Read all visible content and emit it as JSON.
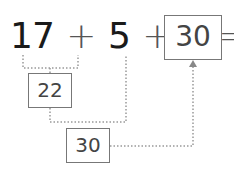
{
  "equation": {
    "terms": [
      "17",
      "5",
      "8"
    ],
    "operators": [
      "+",
      "+",
      "="
    ],
    "result": "30"
  },
  "intermediate_boxes": [
    {
      "label": "22",
      "connects": [
        "17",
        "5"
      ]
    },
    {
      "label": "30",
      "connects": [
        "22",
        "8"
      ]
    }
  ],
  "colors": {
    "text": "#1a1a1a",
    "box_border": "#777777",
    "dotted_line": "#999999"
  }
}
